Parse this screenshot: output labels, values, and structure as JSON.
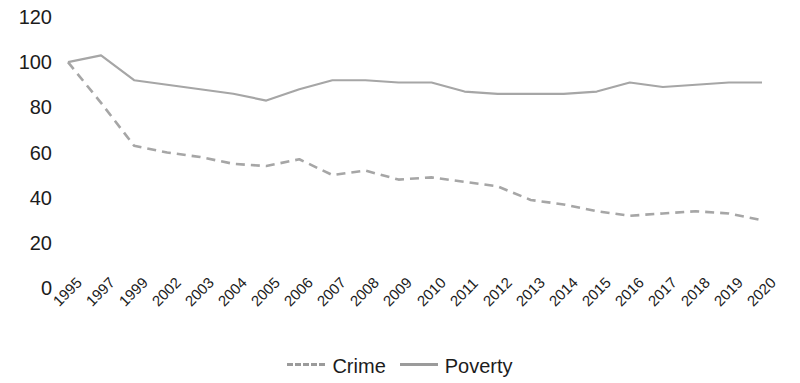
{
  "chart_data": {
    "type": "line",
    "title": "",
    "xlabel": "",
    "ylabel": "",
    "ylim": [
      0,
      120
    ],
    "ytick_labels": [
      "120",
      "100",
      "80",
      "60",
      "40",
      "20",
      "0"
    ],
    "ytick_values": [
      120,
      100,
      80,
      60,
      40,
      20,
      0
    ],
    "grid": false,
    "legend_position": "bottom-center",
    "categories": [
      "1995",
      "1997",
      "1999",
      "2002",
      "2003",
      "2004",
      "2005",
      "2006",
      "2007",
      "2008",
      "2009",
      "2010",
      "2011",
      "2012",
      "2013",
      "2014",
      "2015",
      "2016",
      "2017",
      "2018",
      "2019",
      "2020"
    ],
    "series": [
      {
        "name": "Crime",
        "style": "dashed",
        "color": "#a6a6a6",
        "values": [
          100,
          82,
          63,
          60,
          58,
          55,
          54,
          57,
          50,
          52,
          48,
          49,
          47,
          45,
          39,
          37,
          34,
          32,
          33,
          34,
          33,
          30
        ]
      },
      {
        "name": "Poverty",
        "style": "solid",
        "color": "#a6a6a6",
        "values": [
          100,
          103,
          92,
          90,
          88,
          86,
          83,
          88,
          92,
          92,
          91,
          91,
          87,
          86,
          86,
          86,
          87,
          91,
          89,
          90,
          91,
          91
        ]
      }
    ]
  },
  "legend": {
    "items": [
      {
        "label": "Crime",
        "style": "dashed"
      },
      {
        "label": "Poverty",
        "style": "solid"
      }
    ]
  }
}
